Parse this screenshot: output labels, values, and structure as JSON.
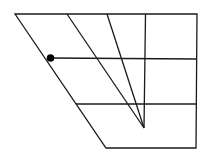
{
  "diagram": {
    "colors": {
      "stroke": "#1a1a1a",
      "background": "#ffffff",
      "dot": "#000000"
    },
    "stroke_width": 1.3,
    "outer_frame": [
      [
        15,
        14
      ],
      [
        197,
        14
      ],
      [
        196,
        148
      ],
      [
        106,
        148
      ]
    ],
    "lines": [
      {
        "name": "middle-horizontal",
        "from": [
          50,
          58
        ],
        "to": [
          197,
          59
        ]
      },
      {
        "name": "lower-horizontal",
        "from": [
          76,
          104
        ],
        "to": [
          196,
          104
        ]
      },
      {
        "name": "diagonal-left",
        "from": [
          67,
          14
        ],
        "to": [
          144,
          128
        ]
      },
      {
        "name": "diagonal-right",
        "from": [
          107,
          14
        ],
        "to": [
          144,
          128
        ]
      },
      {
        "name": "vertical",
        "from": [
          145.5,
          14
        ],
        "to": [
          144,
          128
        ]
      }
    ],
    "dot": {
      "cx": 50.5,
      "cy": 58,
      "r": 3.8
    }
  }
}
